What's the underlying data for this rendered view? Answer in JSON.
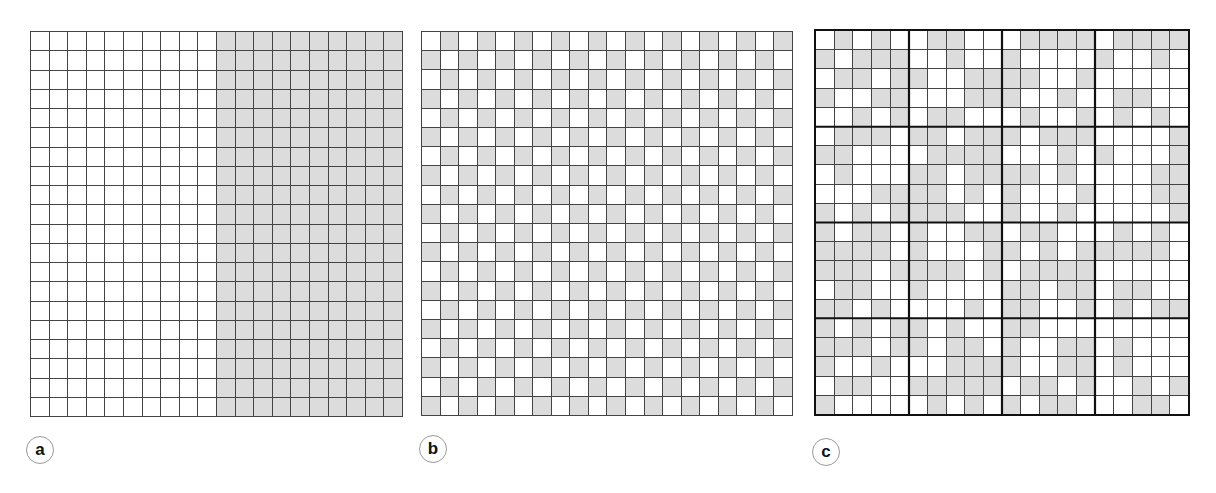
{
  "colors": {
    "shaded": "#dcdcdc",
    "empty": "#ffffff",
    "line": "#444444",
    "block_line": "#111111"
  },
  "panels": [
    {
      "label": "a",
      "description": "20x20 grid, left half unshaded, right half shaded",
      "rows": 20,
      "cols": 20,
      "pattern": "half"
    },
    {
      "label": "b",
      "description": "20x20 grid, checkerboard pattern",
      "rows": 20,
      "cols": 20,
      "pattern": "checker"
    },
    {
      "label": "c",
      "description": "20x20 grid subdivided into 4x4 blocks of 5x5 cells, irregular shading",
      "rows": 20,
      "cols": 20,
      "block_size": 5,
      "pattern": "matrix",
      "matrix": [
        "01010011000111101111",
        "10111001001000010010",
        "01101100111100100000",
        "10011000111001001100",
        "00101011000100101010",
        "01110110111011100001",
        "11000011110001010001",
        "01000110111101000011",
        "00011110101000100011",
        "10101111001001000001",
        "10110100110110001010",
        "11110100011010111110",
        "11101111010111100000",
        "01100100001101101100",
        "11010000101100101011",
        "10101101001100000000",
        "11101101101001101000",
        "10010001111001101000",
        "01100111110110100101",
        "10000010101011000110"
      ]
    }
  ]
}
